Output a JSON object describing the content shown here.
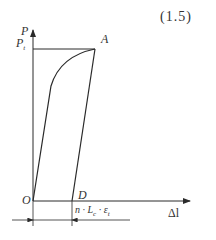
{
  "equation_number": "(1.5)",
  "axes": {
    "y_label": "P",
    "x_label": "Δl"
  },
  "points": {
    "origin": "O",
    "peak": "A",
    "residual": "D",
    "yield_load_label": "P",
    "yield_load_subscript": "t"
  },
  "dimension": {
    "prefix": "n · L",
    "l_subscript": "c",
    "mid": " · ε",
    "eps_subscript": "t"
  },
  "colors": {
    "line": "#2a2a2a"
  }
}
